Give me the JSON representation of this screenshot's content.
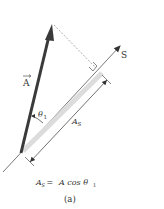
{
  "figure": {
    "vector_label": "A",
    "axis_label": "S",
    "angle_label": "θ",
    "angle_subscript": "1",
    "projection_label": "A",
    "projection_subscript": "S",
    "equation": {
      "lhs": "A",
      "lhs_subscript": "S",
      "equals": " = ",
      "rhs": "A cos θ",
      "rhs_subscript": "1"
    },
    "caption": "(a)"
  },
  "colors": {
    "vector": "#3a3a3a",
    "axis": "#444444",
    "projection_band": "#d9d9d9",
    "dashed": "#888888",
    "text": "#333333"
  }
}
